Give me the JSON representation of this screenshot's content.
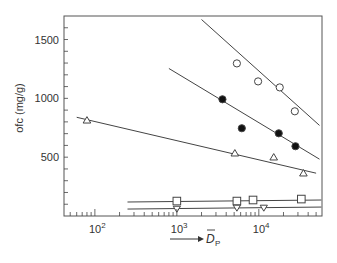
{
  "chart_data": {
    "type": "scatter",
    "title": "",
    "xlabel": "D̄p",
    "xlabel_main": "D",
    "xlabel_sub": "P",
    "ylabel": "ofc (mg/g)",
    "xscale": "log",
    "xlim": [
      42,
      59000
    ],
    "ylim": [
      0,
      1700
    ],
    "x_ticks": [
      {
        "value": 100,
        "label_base": "10",
        "label_exp": "2"
      },
      {
        "value": 1000,
        "label_base": "10",
        "label_exp": "3"
      },
      {
        "value": 10000,
        "label_base": "10",
        "label_exp": "4"
      }
    ],
    "y_ticks": [
      500,
      1000,
      1500
    ],
    "grid": false,
    "legend": null,
    "series": [
      {
        "name": "open circles",
        "marker": "circle-open",
        "points": [
          [
            5400,
            1297
          ],
          [
            9800,
            1144
          ],
          [
            18000,
            1093
          ],
          [
            27500,
            890
          ]
        ],
        "fit_line": [
          [
            2000,
            1670
          ],
          [
            55000,
            770
          ]
        ]
      },
      {
        "name": "filled circles",
        "marker": "circle-filled",
        "points": [
          [
            3600,
            992
          ],
          [
            6200,
            746
          ],
          [
            17500,
            703
          ],
          [
            28000,
            593
          ]
        ],
        "fit_line": [
          [
            800,
            1254
          ],
          [
            55000,
            483
          ]
        ]
      },
      {
        "name": "open triangles",
        "marker": "triangle-up",
        "points": [
          [
            80,
            814
          ],
          [
            5100,
            534
          ],
          [
            15200,
            500
          ],
          [
            35000,
            364
          ]
        ],
        "fit_line": [
          [
            60,
            839
          ],
          [
            50000,
            364
          ]
        ]
      },
      {
        "name": "open squares",
        "marker": "square-open",
        "points": [
          [
            1000,
            127
          ],
          [
            5400,
            127
          ],
          [
            8500,
            136
          ],
          [
            33000,
            144
          ]
        ],
        "fit_line": [
          [
            250,
            119
          ],
          [
            58000,
            136
          ]
        ]
      },
      {
        "name": "inverted triangles",
        "marker": "triangle-down",
        "points": [
          [
            1000,
            59
          ],
          [
            5400,
            68
          ],
          [
            11500,
            68
          ]
        ],
        "fit_line": [
          [
            250,
            59
          ],
          [
            58000,
            76
          ]
        ]
      }
    ]
  }
}
